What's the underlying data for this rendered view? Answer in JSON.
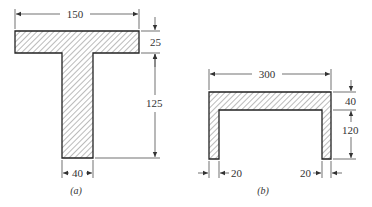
{
  "figure_a": {
    "caption": "(a)",
    "shape": "T-section",
    "dimensions": {
      "flange_width": "150",
      "flange_thickness": "25",
      "web_height": "125",
      "web_width": "40"
    }
  },
  "figure_b": {
    "caption": "(b)",
    "shape": "channel-section",
    "dimensions": {
      "overall_width": "300",
      "flange_thickness": "40",
      "leg_height": "120",
      "left_leg_width": "20",
      "right_leg_width": "20"
    }
  },
  "colors": {
    "line": "#222222",
    "hatch": "#444444",
    "background": "#ffffff"
  }
}
